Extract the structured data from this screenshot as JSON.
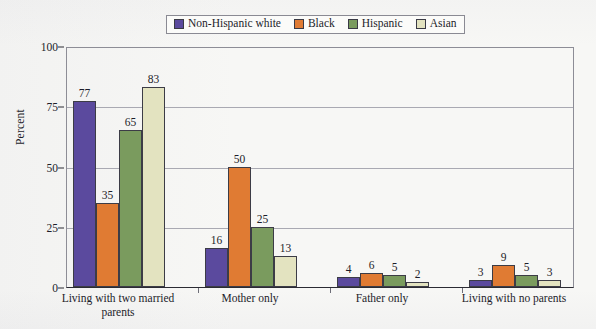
{
  "chart_data": {
    "type": "bar",
    "title": "",
    "xlabel": "",
    "ylabel": "Percent",
    "ylim": [
      0,
      100
    ],
    "yticks": [
      0,
      25,
      50,
      75,
      100
    ],
    "grid": true,
    "legend_position": "top-center",
    "categories": [
      "Living with two married parents",
      "Mother only",
      "Father only",
      "Living with no parents"
    ],
    "category_lines": [
      [
        "Living with two married",
        "parents"
      ],
      [
        "Mother only"
      ],
      [
        "Father only"
      ],
      [
        "Living with no parents"
      ]
    ],
    "series": [
      {
        "name": "Non-Hispanic white",
        "color": "#5b4a9e",
        "values": [
          77,
          16,
          4,
          3
        ]
      },
      {
        "name": "Black",
        "color": "#e07b33",
        "values": [
          35,
          50,
          6,
          9
        ]
      },
      {
        "name": "Hispanic",
        "color": "#7a9b5e",
        "values": [
          65,
          25,
          5,
          5
        ]
      },
      {
        "name": "Asian",
        "color": "#e3e3c0",
        "values": [
          83,
          13,
          2,
          3
        ]
      }
    ]
  },
  "legend": {
    "items": [
      {
        "label": "Non-Hispanic white",
        "color": "#5b4a9e"
      },
      {
        "label": "Black",
        "color": "#e07b33"
      },
      {
        "label": "Hispanic",
        "color": "#7a9b5e"
      },
      {
        "label": "Asian",
        "color": "#e3e3c0"
      }
    ]
  }
}
